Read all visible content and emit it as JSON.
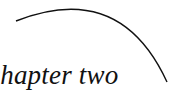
{
  "heading": {
    "text": "chapter two",
    "visible_text": "apter two"
  },
  "colors": {
    "text": "#111111",
    "arc": "#111111",
    "background": "#ffffff"
  }
}
